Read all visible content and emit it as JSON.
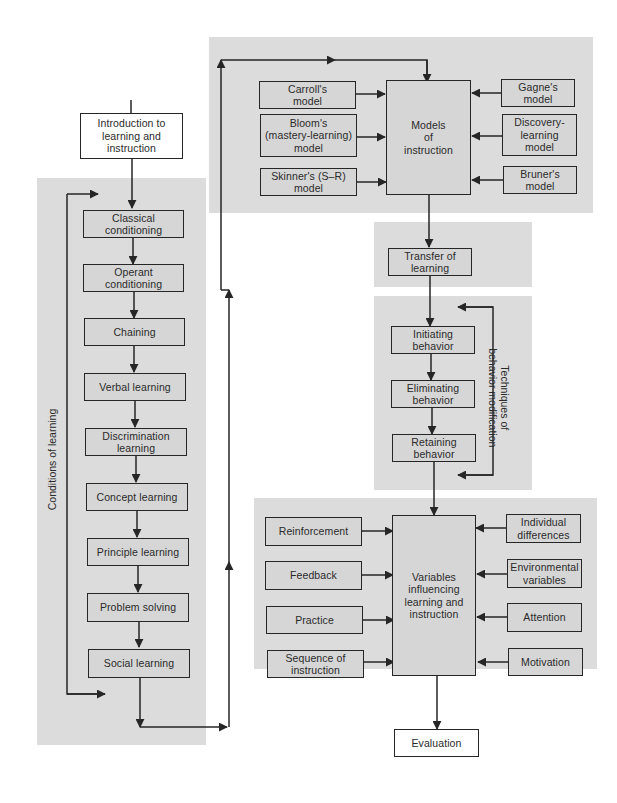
{
  "diagram": {
    "type": "flowchart",
    "colors": {
      "panel": "#dcdcdc",
      "line": "#262626",
      "box_fill": "#d6d6d6",
      "white_box": "#ffffff"
    },
    "start": {
      "label": "Introduction to\nlearning and\ninstruction"
    },
    "conditions_of_learning": {
      "side_label": "Conditions of learning",
      "steps": [
        {
          "label": "Classical\nconditioning"
        },
        {
          "label": "Operant\nconditioning"
        },
        {
          "label": "Chaining"
        },
        {
          "label": "Verbal  learning"
        },
        {
          "label": "Discrimination\nlearning"
        },
        {
          "label": "Concept learning"
        },
        {
          "label": "Principle  learning"
        },
        {
          "label": "Problem  solving"
        },
        {
          "label": "Social  learning"
        }
      ]
    },
    "models_of_instruction": {
      "center": {
        "label": "Models\nof\ninstruction"
      },
      "left_inputs": [
        {
          "label": "Carroll's\nmodel"
        },
        {
          "label": "Bloom's\n(mastery-learning)\nmodel"
        },
        {
          "label": "Skinner's (S–R)\nmodel"
        }
      ],
      "right_inputs": [
        {
          "label": "Gagne's\nmodel"
        },
        {
          "label": "Discovery-\nlearning\nmodel"
        },
        {
          "label": "Bruner's\nmodel"
        }
      ]
    },
    "transfer": {
      "label": "Transfer of\nlearning"
    },
    "behavior_modification": {
      "side_label": "Techniques of\nbehavior modification",
      "steps": [
        {
          "label": "Initiating\nbehavior"
        },
        {
          "label": "Eliminating\nbehavior"
        },
        {
          "label": "Retaining\nbehavior"
        }
      ]
    },
    "variables": {
      "center": {
        "label": "Variables\ninfluencing\nlearning and\ninstruction"
      },
      "left_inputs": [
        {
          "label": "Reinforcement"
        },
        {
          "label": "Feedback"
        },
        {
          "label": "Practice"
        },
        {
          "label": "Sequence of\ninstruction"
        }
      ],
      "right_inputs": [
        {
          "label": "Individual\ndifferences"
        },
        {
          "label": "Environmental\nvariables"
        },
        {
          "label": "Attention"
        },
        {
          "label": "Motivation"
        }
      ]
    },
    "end": {
      "label": "Evaluation"
    }
  }
}
